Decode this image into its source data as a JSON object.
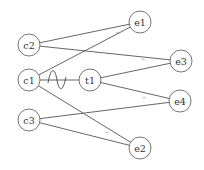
{
  "diagram": {
    "type": "bipartite-graph",
    "colors": {
      "edge": "#555555",
      "node_stroke": "#666666",
      "node_fill": "#ffffff",
      "label": "#333333",
      "mark": "#777777"
    },
    "nodes": [
      {
        "id": "c2",
        "label": "c2",
        "x": 29,
        "y": 45,
        "r": 11
      },
      {
        "id": "c1",
        "label": "c1",
        "x": 29,
        "y": 80,
        "r": 11
      },
      {
        "id": "c3",
        "label": "c3",
        "x": 29,
        "y": 120,
        "r": 11
      },
      {
        "id": "t1",
        "label": "t1",
        "x": 90,
        "y": 80,
        "r": 11
      },
      {
        "id": "e1",
        "label": "e1",
        "x": 140,
        "y": 22,
        "r": 11
      },
      {
        "id": "e3",
        "label": "e3",
        "x": 181,
        "y": 61,
        "r": 11
      },
      {
        "id": "e4",
        "label": "e4",
        "x": 180,
        "y": 101,
        "r": 11
      },
      {
        "id": "e2",
        "label": "e2",
        "x": 140,
        "y": 148,
        "r": 11
      }
    ],
    "edges": [
      {
        "from": "c2",
        "to": "e1",
        "mark": "^",
        "mark_x": 118,
        "mark_y": 33
      },
      {
        "from": "c2",
        "to": "e3",
        "mark": "^",
        "mark_x": 143,
        "mark_y": 60
      },
      {
        "from": "c1",
        "to": "e1",
        "mark": "",
        "mark_x": 0,
        "mark_y": 0
      },
      {
        "from": "c1",
        "to": "e2",
        "mark": "^",
        "mark_x": 107,
        "mark_y": 133
      },
      {
        "from": "c1",
        "to": "t1",
        "mark": "~",
        "mark_x": 57,
        "mark_y": 80
      },
      {
        "from": "t1",
        "to": "e3",
        "mark": "",
        "mark_x": 0,
        "mark_y": 0
      },
      {
        "from": "t1",
        "to": "e4",
        "mark": "^",
        "mark_x": 144,
        "mark_y": 98
      },
      {
        "from": "c3",
        "to": "e4",
        "mark": "",
        "mark_x": 0,
        "mark_y": 0
      },
      {
        "from": "c3",
        "to": "e2",
        "mark": "",
        "mark_x": 0,
        "mark_y": 0
      }
    ]
  }
}
